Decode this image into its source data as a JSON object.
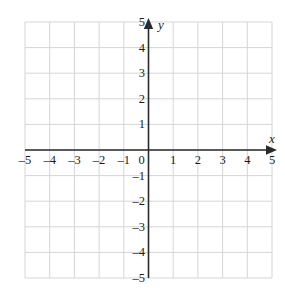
{
  "figure": {
    "kind": "cartesian-coordinate-grid",
    "background_color": "#ffffff",
    "grid_color": "#d5d5d5",
    "axis_color": "#2a2a2a",
    "label_color": "#1b1b1b"
  },
  "axes": {
    "x": {
      "name": "x",
      "min": -5,
      "max": 5,
      "step": 1,
      "arrow": "positive-end",
      "tick_labels": [
        "–5",
        "–4",
        "–3",
        "–2",
        "–1",
        "0",
        "1",
        "2",
        "3",
        "4",
        "5"
      ],
      "tick_values": [
        -5,
        -4,
        -3,
        -2,
        -1,
        0,
        1,
        2,
        3,
        4,
        5
      ]
    },
    "y": {
      "name": "y",
      "min": -5,
      "max": 5,
      "step": 1,
      "arrow": "positive-end",
      "tick_labels": [
        "–5",
        "–4",
        "–3",
        "–2",
        "–1",
        "1",
        "2",
        "3",
        "4",
        "5"
      ],
      "tick_values": [
        -5,
        -4,
        -3,
        -2,
        -1,
        1,
        2,
        3,
        4,
        5
      ]
    },
    "origin_label": "0"
  },
  "chart_data": {
    "type": "scatter",
    "title": "",
    "subtitle": "",
    "xlabel": "x",
    "ylabel": "y",
    "xlim": [
      -5,
      5
    ],
    "ylim": [
      -5,
      5
    ],
    "xticks": [
      -5,
      -4,
      -3,
      -2,
      -1,
      0,
      1,
      2,
      3,
      4,
      5
    ],
    "yticks": [
      -5,
      -4,
      -3,
      -2,
      -1,
      0,
      1,
      2,
      3,
      4,
      5
    ],
    "xticklabels": [
      "–5",
      "–4",
      "–3",
      "–2",
      "–1",
      "0",
      "1",
      "2",
      "3",
      "4",
      "5"
    ],
    "yticklabels": [
      "–5",
      "–4",
      "–3",
      "–2",
      "–1",
      "0",
      "1",
      "2",
      "3",
      "4",
      "5"
    ],
    "grid": true,
    "grid_step": 1,
    "legend": null,
    "legend_position": "none",
    "annotations": [],
    "series": [],
    "x": [],
    "values": []
  }
}
